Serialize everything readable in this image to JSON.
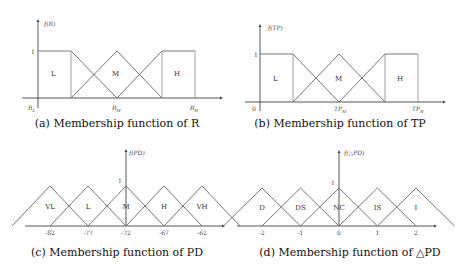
{
  "chart_data": [
    {
      "type": "line",
      "panel": "a",
      "caption": "(a) Membership function of R",
      "ylabel": "f(R)",
      "y_tick": "1",
      "x_ticks": [
        "R_L",
        "R_M",
        "R_H"
      ],
      "sets": [
        {
          "name": "L",
          "points": [
            [
              0,
              1
            ],
            [
              0.4286,
              1
            ],
            [
              0.4286,
              0
            ],
            [
              0.4286,
              1
            ],
            [
              1.0,
              0
            ]
          ]
        },
        {
          "name": "M",
          "points": [
            [
              0.4286,
              0
            ],
            [
              1.0,
              1
            ],
            [
              1.5714,
              0
            ]
          ]
        },
        {
          "name": "H",
          "points": [
            [
              1.0,
              0
            ],
            [
              1.5714,
              1
            ],
            [
              2.0,
              1
            ],
            [
              2.0,
              0
            ],
            [
              1.5714,
              1
            ],
            [
              1.5714,
              0
            ]
          ]
        }
      ],
      "labels": [
        "L",
        "M",
        "H"
      ]
    },
    {
      "type": "line",
      "panel": "b",
      "caption": "(b) Membership function of TP",
      "ylabel": "f(TP)",
      "y_tick": "1",
      "x_origin_label": "0",
      "x_ticks": [
        "TP_M",
        "TP_H"
      ],
      "labels": [
        "L",
        "M",
        "H"
      ]
    },
    {
      "type": "line",
      "panel": "c",
      "caption": "(c) Membership function of PD",
      "ylabel": "f(PD)",
      "y_tick": "1",
      "x_ticks": [
        -82,
        -77,
        -72,
        -67,
        -62
      ],
      "sets": [
        {
          "name": "VL",
          "center": -82
        },
        {
          "name": "L",
          "center": -77
        },
        {
          "name": "M",
          "center": -72
        },
        {
          "name": "H",
          "center": -67
        },
        {
          "name": "VH",
          "center": -62
        }
      ],
      "half_width": 5
    },
    {
      "type": "line",
      "panel": "d",
      "caption": "(d) Membership function of △PD",
      "ylabel": "f(△PD)",
      "y_tick": "1",
      "x_ticks": [
        -2,
        -1,
        0,
        1,
        2
      ],
      "sets": [
        {
          "name": "D",
          "center": -2
        },
        {
          "name": "DS",
          "center": -1
        },
        {
          "name": "NC",
          "center": 0
        },
        {
          "name": "IS",
          "center": 1
        },
        {
          "name": "I",
          "center": 2
        }
      ],
      "half_width": 1
    }
  ],
  "ticklabels": {
    "a": {
      "rl_main": "R",
      "rl_sub": "L",
      "rm_main": "R",
      "rm_sub": "M",
      "rh_main": "R",
      "rh_sub": "H"
    },
    "b": {
      "zero": "0",
      "tpm_main": "TP",
      "tpm_sub": "M",
      "tph_main": "TP",
      "tph_sub": "H"
    }
  }
}
